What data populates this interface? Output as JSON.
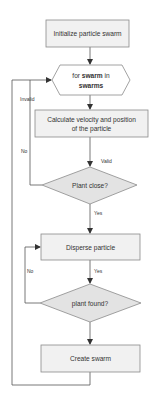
{
  "diagram": {
    "type": "flowchart",
    "nodes": {
      "init": {
        "label": "Initialize particle swarm",
        "shape": "rectangle"
      },
      "loop": {
        "prefix": "for ",
        "bold1": "swarm",
        "mid": " in",
        "bold2": "swarms",
        "shape": "hexagon"
      },
      "calc": {
        "line1": "Calculate velocity and position",
        "line2": "of the particle",
        "shape": "rectangle"
      },
      "plant_close": {
        "label": "Plant close?",
        "shape": "diamond"
      },
      "disperse": {
        "label": "Disperse particle",
        "shape": "rectangle"
      },
      "plant_found": {
        "label": "plant found?",
        "shape": "diamond"
      },
      "create": {
        "label": "Create swarm",
        "shape": "rectangle"
      }
    },
    "edge_labels": {
      "invalid": "Invalid",
      "valid": "Valid",
      "close_no": "No",
      "close_yes": "Yes",
      "found_no": "No",
      "found_yes": "Yes"
    },
    "colors": {
      "box_fill": "#f1f1f1",
      "diamond_fill": "#e3e3e3",
      "stroke": "#8a8a8a",
      "line": "#555555",
      "text": "#333333"
    }
  }
}
